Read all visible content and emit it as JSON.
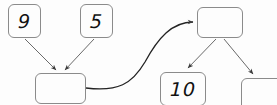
{
  "diagram": {
    "type": "flow-diagram",
    "stroke_color": "#555555",
    "box_border_color": "#8b8b8b",
    "background_color": "#fdfdfd",
    "nodes": [
      {
        "id": "nine",
        "label": "9",
        "empty": false,
        "x": 8,
        "y": 4,
        "w": 33,
        "h": 34
      },
      {
        "id": "five",
        "label": "5",
        "empty": false,
        "x": 80,
        "y": 4,
        "w": 33,
        "h": 34
      },
      {
        "id": "sum",
        "label": "",
        "empty": true,
        "x": 35,
        "y": 73,
        "w": 51,
        "h": 31
      },
      {
        "id": "root",
        "label": "",
        "empty": true,
        "x": 197,
        "y": 7,
        "w": 46,
        "h": 31
      },
      {
        "id": "ten",
        "label": "10",
        "empty": false,
        "x": 160,
        "y": 72,
        "w": 46,
        "h": 34
      },
      {
        "id": "right",
        "label": "",
        "empty": true,
        "x": 241,
        "y": 78,
        "w": 46,
        "h": 34
      }
    ],
    "edges": [
      {
        "id": "nine-to-sum",
        "from": "nine",
        "to": "sum",
        "kind": "straight-arrow"
      },
      {
        "id": "five-to-sum",
        "from": "five",
        "to": "sum",
        "kind": "straight-arrow"
      },
      {
        "id": "sum-to-root",
        "from": "sum",
        "to": "root",
        "kind": "curved-arrow"
      },
      {
        "id": "root-to-ten",
        "from": "root",
        "to": "ten",
        "kind": "straight-arrow"
      },
      {
        "id": "root-to-right",
        "from": "root",
        "to": "right",
        "kind": "straight-arrow"
      }
    ]
  }
}
